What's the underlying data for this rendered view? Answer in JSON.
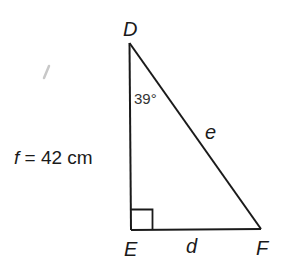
{
  "diagram": {
    "type": "right-triangle",
    "vertices": {
      "D": {
        "label": "D",
        "x": 129,
        "y": 43
      },
      "E": {
        "label": "E",
        "x": 131,
        "y": 230
      },
      "F": {
        "label": "F",
        "x": 261,
        "y": 229
      }
    },
    "sides": {
      "f": {
        "label": "f",
        "between": [
          "D",
          "E"
        ],
        "given_text": "f = 42 cm",
        "value": "42 cm"
      },
      "d": {
        "label": "d",
        "between": [
          "E",
          "F"
        ]
      },
      "e": {
        "label": "e",
        "between": [
          "D",
          "F"
        ]
      }
    },
    "angles": {
      "D": {
        "value": "39°"
      },
      "E": {
        "right_angle": true
      }
    },
    "labels": {
      "D": "D",
      "E": "E",
      "F": "F",
      "d": "d",
      "e": "e",
      "angle_D": "39°",
      "given_f_var": "f",
      "given_f_rest": " = 42 cm"
    },
    "colors": {
      "stroke": "#1a1a1a",
      "background": "#ffffff"
    }
  }
}
